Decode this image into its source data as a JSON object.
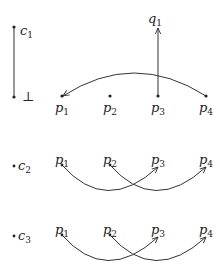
{
  "diagram": {
    "row1": {
      "chain": {
        "top_label": "c",
        "top_sub": "1",
        "bottom_label": "⊥"
      },
      "q": {
        "label": "q",
        "sub": "1"
      },
      "points": [
        {
          "label": "p",
          "sub": "1"
        },
        {
          "label": "p",
          "sub": "2"
        },
        {
          "label": "p",
          "sub": "3"
        },
        {
          "label": "p",
          "sub": "4"
        }
      ],
      "edges": [
        {
          "from": "p3",
          "to": "q1",
          "type": "straight-arrow"
        },
        {
          "from": "p4",
          "to": "p1",
          "type": "arc-arrow"
        }
      ]
    },
    "row2": {
      "c": {
        "label": "c",
        "sub": "2"
      },
      "points": [
        {
          "label": "p",
          "sub": "1"
        },
        {
          "label": "p",
          "sub": "2"
        },
        {
          "label": "p",
          "sub": "3"
        },
        {
          "label": "p",
          "sub": "4"
        }
      ],
      "edges": [
        {
          "from": "p1",
          "to": "p3",
          "type": "arc-arrow"
        },
        {
          "from": "p2",
          "to": "p4",
          "type": "arc-arrow"
        }
      ]
    },
    "row3": {
      "c": {
        "label": "c",
        "sub": "3"
      },
      "points": [
        {
          "label": "p",
          "sub": "1"
        },
        {
          "label": "p",
          "sub": "2"
        },
        {
          "label": "p",
          "sub": "3"
        },
        {
          "label": "p",
          "sub": "4"
        }
      ],
      "edges": [
        {
          "from": "p1",
          "to": "p3",
          "type": "arc-arrow"
        },
        {
          "from": "p2",
          "to": "p4",
          "type": "arc-arrow"
        }
      ]
    }
  }
}
